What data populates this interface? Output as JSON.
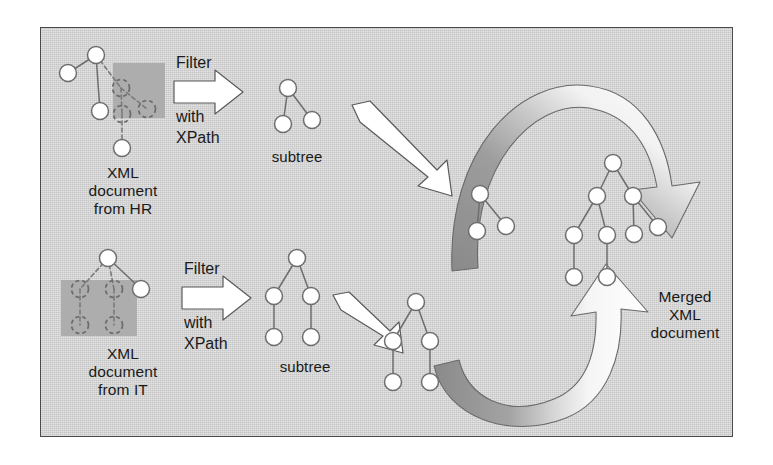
{
  "diagram": {
    "panel": {
      "background": "#d2d2d2",
      "border_color": "#4a4a4a"
    },
    "colors": {
      "node_fill": "#ffffff",
      "node_stroke": "#6e6e6e",
      "edge": "#6e6e6e",
      "highlight_box": "#a8a8a8",
      "arrow_fill": "#ffffff",
      "arrow_stroke": "#5a5a5a",
      "curve_tail": "#8e8e8e",
      "text": "#1a1a1a"
    },
    "labels": {
      "source_hr": "XML\ndocument\nfrom HR",
      "source_it": "XML\ndocument\nfrom IT",
      "subtree_top": "subtree",
      "subtree_bottom": "subtree",
      "merged": "Merged\nXML\ndocument",
      "filter_top_1": "Filter",
      "filter_top_2": "with",
      "filter_top_3": "XPath",
      "filter_bottom_1": "Filter",
      "filter_bottom_2": "with",
      "filter_bottom_3": "XPath"
    },
    "trees": {
      "source_hr": {
        "name": "XML document from HR",
        "nodes": [
          {
            "id": "a",
            "x": 96,
            "y": 55,
            "style": "solid"
          },
          {
            "id": "b",
            "x": 68,
            "y": 73,
            "style": "solid"
          },
          {
            "id": "c",
            "x": 121,
            "y": 88,
            "style": "dashed"
          },
          {
            "id": "d",
            "x": 100,
            "y": 111,
            "style": "solid"
          },
          {
            "id": "e",
            "x": 147,
            "y": 109,
            "style": "dashed"
          },
          {
            "id": "f",
            "x": 122,
            "y": 114,
            "style": "dashed"
          },
          {
            "id": "g",
            "x": 122,
            "y": 148,
            "style": "solid"
          }
        ],
        "edges": [
          [
            "a",
            "b"
          ],
          [
            "a",
            "c"
          ],
          [
            "a",
            "d"
          ],
          [
            "c",
            "e"
          ],
          [
            "c",
            "f"
          ],
          [
            "f",
            "g"
          ]
        ],
        "highlight": {
          "x": 113,
          "y": 63,
          "w": 52,
          "h": 55
        }
      },
      "source_it": {
        "name": "XML document from IT",
        "nodes": [
          {
            "id": "a",
            "x": 108,
            "y": 258,
            "style": "solid"
          },
          {
            "id": "b",
            "x": 80,
            "y": 289,
            "style": "dashed"
          },
          {
            "id": "c",
            "x": 114,
            "y": 289,
            "style": "dashed"
          },
          {
            "id": "d",
            "x": 141,
            "y": 289,
            "style": "solid"
          },
          {
            "id": "e",
            "x": 80,
            "y": 325,
            "style": "dashed"
          },
          {
            "id": "f",
            "x": 114,
            "y": 325,
            "style": "dashed"
          }
        ],
        "edges": [
          [
            "a",
            "b"
          ],
          [
            "a",
            "c"
          ],
          [
            "a",
            "d"
          ],
          [
            "b",
            "e"
          ],
          [
            "c",
            "f"
          ]
        ],
        "highlight": {
          "x": 61,
          "y": 280,
          "w": 76,
          "h": 56
        }
      },
      "subtree_top": {
        "name": "subtree extracted from HR document",
        "nodes": [
          {
            "id": "a",
            "x": 288,
            "y": 88,
            "style": "solid"
          },
          {
            "id": "b",
            "x": 283,
            "y": 124,
            "style": "solid"
          },
          {
            "id": "c",
            "x": 312,
            "y": 120,
            "style": "solid"
          }
        ],
        "edges": [
          [
            "a",
            "b"
          ],
          [
            "a",
            "c"
          ]
        ]
      },
      "subtree_bottom": {
        "name": "subtree extracted from IT document",
        "nodes": [
          {
            "id": "a",
            "x": 297,
            "y": 258,
            "style": "solid"
          },
          {
            "id": "b",
            "x": 274,
            "y": 296,
            "style": "solid"
          },
          {
            "id": "c",
            "x": 311,
            "y": 296,
            "style": "solid"
          },
          {
            "id": "d",
            "x": 274,
            "y": 337,
            "style": "solid"
          },
          {
            "id": "e",
            "x": 311,
            "y": 337,
            "style": "solid"
          }
        ],
        "edges": [
          [
            "a",
            "b"
          ],
          [
            "a",
            "c"
          ],
          [
            "b",
            "d"
          ],
          [
            "c",
            "e"
          ]
        ]
      },
      "staged_top": {
        "name": "subtree in transit from HR",
        "nodes": [
          {
            "id": "a",
            "x": 480,
            "y": 194,
            "style": "solid"
          },
          {
            "id": "b",
            "x": 477,
            "y": 231,
            "style": "solid"
          },
          {
            "id": "c",
            "x": 506,
            "y": 226,
            "style": "solid"
          }
        ],
        "edges": [
          [
            "a",
            "b"
          ],
          [
            "a",
            "c"
          ]
        ]
      },
      "staged_bottom": {
        "name": "subtree in transit from IT",
        "nodes": [
          {
            "id": "a",
            "x": 416,
            "y": 302,
            "style": "solid"
          },
          {
            "id": "b",
            "x": 393,
            "y": 341,
            "style": "solid"
          },
          {
            "id": "c",
            "x": 430,
            "y": 341,
            "style": "solid"
          },
          {
            "id": "d",
            "x": 393,
            "y": 382,
            "style": "solid"
          },
          {
            "id": "e",
            "x": 430,
            "y": 382,
            "style": "solid"
          }
        ],
        "edges": [
          [
            "a",
            "b"
          ],
          [
            "a",
            "c"
          ],
          [
            "b",
            "d"
          ],
          [
            "c",
            "e"
          ]
        ]
      },
      "merged": {
        "name": "merged XML document tree",
        "nodes": [
          {
            "id": "a",
            "x": 613,
            "y": 163,
            "style": "solid"
          },
          {
            "id": "b",
            "x": 597,
            "y": 196,
            "style": "solid"
          },
          {
            "id": "c",
            "x": 633,
            "y": 196,
            "style": "solid"
          },
          {
            "id": "d",
            "x": 574,
            "y": 235,
            "style": "solid"
          },
          {
            "id": "e",
            "x": 607,
            "y": 235,
            "style": "solid"
          },
          {
            "id": "f",
            "x": 634,
            "y": 234,
            "style": "solid"
          },
          {
            "id": "g",
            "x": 658,
            "y": 227,
            "style": "solid"
          },
          {
            "id": "h",
            "x": 574,
            "y": 277,
            "style": "solid"
          },
          {
            "id": "i",
            "x": 607,
            "y": 277,
            "style": "solid"
          }
        ],
        "edges": [
          [
            "a",
            "b"
          ],
          [
            "a",
            "c"
          ],
          [
            "b",
            "d"
          ],
          [
            "b",
            "e"
          ],
          [
            "c",
            "f"
          ],
          [
            "c",
            "g"
          ],
          [
            "d",
            "h"
          ],
          [
            "e",
            "i"
          ]
        ]
      }
    },
    "arrows": [
      {
        "name": "filter-arrow-top",
        "kind": "block-right"
      },
      {
        "name": "filter-arrow-bottom",
        "kind": "block-right"
      },
      {
        "name": "transfer-arrow-top",
        "kind": "diagonal-down-right"
      },
      {
        "name": "transfer-arrow-bottom",
        "kind": "diagonal-down-right"
      },
      {
        "name": "merge-curve-top",
        "kind": "curved-arc"
      },
      {
        "name": "merge-curve-bottom",
        "kind": "curved-arc"
      }
    ]
  }
}
